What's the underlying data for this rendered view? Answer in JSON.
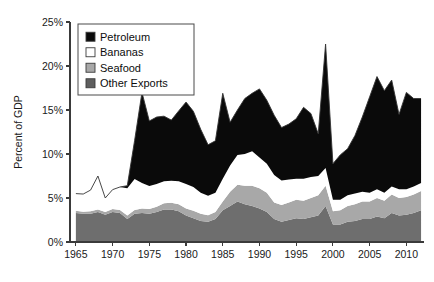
{
  "chart_data": {
    "type": "area",
    "stacked": true,
    "title": "",
    "subtitle": "",
    "xlabel": "",
    "ylabel": "Percent of GDP",
    "xlim": [
      1964.2,
      2012.4
    ],
    "ylim": [
      0,
      25
    ],
    "grid": false,
    "legend_position": "top-left",
    "x_tick_labels": [
      "1965",
      "1970",
      "1975",
      "1980",
      "1985",
      "1990",
      "1995",
      "2000",
      "2005",
      "2010"
    ],
    "x_ticks": [
      1965,
      1970,
      1975,
      1980,
      1985,
      1990,
      1995,
      2000,
      2005,
      2010
    ],
    "y_tick_labels": [
      "0%",
      "5%",
      "10%",
      "15%",
      "20%",
      "25%"
    ],
    "y_ticks": [
      0,
      5,
      10,
      15,
      20,
      25
    ],
    "x": [
      1965,
      1966,
      1967,
      1968,
      1969,
      1970,
      1971,
      1972,
      1973,
      1974,
      1975,
      1976,
      1977,
      1978,
      1979,
      1980,
      1981,
      1982,
      1983,
      1984,
      1985,
      1986,
      1987,
      1988,
      1989,
      1990,
      1991,
      1992,
      1993,
      1994,
      1995,
      1996,
      1997,
      1998,
      1999,
      2000,
      2001,
      2002,
      2003,
      2004,
      2005,
      2006,
      2007,
      2008,
      2009,
      2010,
      2011,
      2012
    ],
    "series": [
      {
        "name": "Other Exports",
        "key": "other_exports",
        "color": "#6e6e6e",
        "values": [
          3.3,
          3.2,
          3.2,
          3.4,
          3.1,
          3.4,
          3.3,
          2.6,
          3.2,
          3.3,
          3.2,
          3.4,
          3.7,
          3.7,
          3.5,
          3.0,
          2.7,
          2.4,
          2.3,
          2.6,
          3.6,
          4.1,
          4.6,
          4.3,
          4.1,
          3.8,
          3.4,
          2.6,
          2.3,
          2.5,
          2.7,
          2.6,
          2.8,
          3.0,
          4.1,
          2.0,
          2.0,
          2.3,
          2.4,
          2.6,
          2.6,
          2.9,
          2.7,
          3.3,
          3.0,
          3.1,
          3.3,
          3.6
        ]
      },
      {
        "name": "Seafood",
        "key": "seafood",
        "color": "#a8a8a8",
        "values": [
          0.25,
          0.25,
          0.3,
          0.3,
          0.3,
          0.35,
          0.35,
          0.4,
          0.45,
          0.5,
          0.55,
          0.6,
          0.7,
          0.75,
          0.8,
          0.8,
          0.85,
          0.8,
          0.75,
          0.8,
          1.0,
          1.6,
          1.9,
          2.1,
          2.3,
          2.3,
          2.2,
          1.9,
          1.9,
          2.0,
          2.1,
          2.1,
          2.2,
          2.3,
          2.3,
          1.5,
          1.6,
          1.8,
          1.9,
          2.0,
          2.0,
          2.1,
          2.0,
          2.1,
          2.0,
          2.0,
          2.1,
          2.2
        ]
      },
      {
        "name": "Bananas",
        "key": "bananas",
        "color": "#ffffff",
        "values": [
          1.95,
          2.0,
          2.4,
          3.8,
          1.6,
          2.2,
          2.6,
          3.1,
          3.5,
          2.9,
          2.6,
          2.6,
          2.5,
          2.5,
          2.6,
          2.8,
          2.7,
          2.4,
          2.2,
          2.2,
          2.6,
          3.0,
          3.4,
          3.6,
          3.9,
          3.5,
          3.3,
          3.1,
          2.8,
          2.6,
          2.4,
          2.5,
          2.4,
          2.2,
          2.0,
          1.3,
          1.2,
          1.2,
          1.2,
          1.1,
          1.0,
          1.0,
          0.9,
          0.9,
          1.0,
          0.9,
          0.9,
          0.9
        ]
      },
      {
        "name": "Petroleum",
        "key": "petroleum",
        "color": "#0a0a0a",
        "values": [
          0.0,
          0.0,
          0.0,
          0.0,
          0.0,
          0.0,
          0.0,
          0.3,
          4.4,
          10.3,
          7.4,
          7.6,
          7.4,
          6.9,
          8.0,
          9.3,
          8.6,
          7.2,
          5.8,
          5.9,
          9.7,
          4.9,
          5.1,
          6.3,
          6.6,
          7.8,
          7.2,
          6.8,
          6.0,
          6.3,
          6.8,
          8.1,
          7.2,
          4.8,
          14.1,
          4.1,
          5.1,
          5.3,
          6.6,
          8.5,
          10.9,
          12.8,
          11.6,
          12.1,
          8.5,
          11.0,
          10.0,
          9.6
        ]
      }
    ]
  },
  "legend": {
    "items": [
      {
        "label": "Petroleum",
        "color": "#0a0a0a"
      },
      {
        "label": "Bananas",
        "color": "#ffffff"
      },
      {
        "label": "Seafood",
        "color": "#a8a8a8"
      },
      {
        "label": "Other Exports",
        "color": "#5e5e5e"
      }
    ]
  },
  "axes": {
    "y_axis_title": "Percent of GDP"
  }
}
